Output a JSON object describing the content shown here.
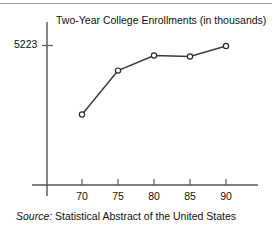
{
  "figure": {
    "top_rule": "horizontal-rule",
    "source_prefix": "Source:",
    "source_text": " Statistical Abstract of the United States"
  },
  "chart_data": {
    "type": "line",
    "title": "Two-Year College Enrollments (in thousands)",
    "xlabel": "",
    "ylabel": "",
    "grid": false,
    "legend": "none",
    "marker": "open-circle",
    "x": [
      70,
      75,
      80,
      85,
      90
    ],
    "x_tick_labels": [
      "70",
      "75",
      "80",
      "85",
      "90"
    ],
    "y_tick_labels": [
      "5223"
    ],
    "y_ticks": [
      5223
    ],
    "values": [
      2650,
      4300,
      4865,
      4827,
      5223
    ],
    "ylim": [
      0,
      5600
    ],
    "xlim": [
      66.5,
      94
    ],
    "series": [
      {
        "name": "Two-Year College Enrollments",
        "values": [
          2650,
          4300,
          4865,
          4827,
          5223
        ]
      }
    ],
    "annotations": []
  },
  "colors": {
    "line": "#3a3a3a",
    "axis": "#555555",
    "marker_fill": "#ffffff",
    "text": "#111111",
    "rule": "#9a9a9a"
  }
}
